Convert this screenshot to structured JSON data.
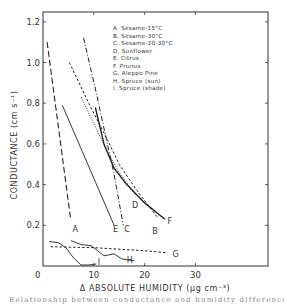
{
  "chart_data": {
    "type": "line",
    "title": "",
    "xlabel": "Δ ABSOLUTE HUMIDITY (μg cm⁻³)",
    "ylabel": "CONDUCTANCE (cm s⁻¹)",
    "xlim": [
      0,
      43
    ],
    "ylim": [
      0,
      1.25
    ],
    "x_ticks": [
      0,
      10,
      20,
      30
    ],
    "x_tick_labels": [
      "0",
      "10",
      "20",
      "30"
    ],
    "y_ticks": [
      0.2,
      0.4,
      0.6,
      0.8,
      1.0,
      1.2
    ],
    "y_tick_labels": [
      "0.2",
      "0.4",
      "0.6",
      "0.8",
      "1.0",
      "1.2"
    ],
    "origin_label": "0",
    "grid": false,
    "legend_position": "upper right (inside plot)",
    "legend": [
      "A. Sesame-15°C",
      "B. Sesame-30°C",
      "C. Sesame-20-30°C",
      "D. Sunflower",
      "E. Citrus",
      "F. Prunus",
      "G. Aleppo Pine",
      "H. Spruce (sun)",
      "I. Spruce (shade)"
    ],
    "series": [
      {
        "id": "A",
        "name": "Sesame-15°C",
        "style": "long-dash",
        "x": [
          0.8,
          5.4
        ],
        "y": [
          1.1,
          0.24
        ]
      },
      {
        "id": "B",
        "name": "Sesame-30°C",
        "style": "short-dash",
        "x": [
          5.2,
          9.0,
          12.5,
          15.0,
          18.5,
          22.5
        ],
        "y": [
          1.0,
          0.8,
          0.63,
          0.5,
          0.37,
          0.24
        ]
      },
      {
        "id": "C",
        "name": "Sesame-20-30°C",
        "style": "dash-dot",
        "x": [
          8.0,
          10.5,
          12.5,
          14.0,
          15.8
        ],
        "y": [
          1.12,
          0.85,
          0.62,
          0.45,
          0.2
        ]
      },
      {
        "id": "D",
        "name": "Sunflower",
        "style": "dotted",
        "x": [
          7.5,
          10.0,
          12.5,
          15.0,
          18.5
        ],
        "y": [
          0.83,
          0.7,
          0.57,
          0.46,
          0.34
        ]
      },
      {
        "id": "E",
        "name": "Citrus",
        "style": "solid",
        "x": [
          3.8,
          14.0
        ],
        "y": [
          0.79,
          0.2
        ]
      },
      {
        "id": "F",
        "name": "Prunus",
        "style": "solid-thick",
        "x": [
          10.3,
          12.0,
          14.0,
          16.5,
          20.0,
          24.0
        ],
        "y": [
          0.78,
          0.6,
          0.48,
          0.4,
          0.31,
          0.23
        ]
      },
      {
        "id": "G",
        "name": "Aleppo Pine",
        "style": "short-dash",
        "x": [
          1.5,
          10.0,
          20.0,
          24.5
        ],
        "y": [
          0.095,
          0.09,
          0.075,
          0.065
        ]
      },
      {
        "id": "H",
        "name": "Spruce (sun)",
        "style": "solid",
        "x": [
          5.5,
          7.5,
          9.5,
          12.0,
          14.0,
          15.5,
          18.0
        ],
        "y": [
          0.125,
          0.105,
          0.1,
          0.05,
          0.06,
          0.035,
          0.025
        ]
      },
      {
        "id": "I",
        "name": "Spruce (shade)",
        "style": "solid",
        "x": [
          1.2,
          3.0,
          4.5,
          6.0,
          7.5,
          9.0,
          10.5
        ],
        "y": [
          0.12,
          0.115,
          0.09,
          0.04,
          0.005,
          0.005,
          0.01
        ]
      }
    ],
    "curve_end_labels": {
      "A": {
        "x": 5.8,
        "y": 0.18
      },
      "E": {
        "x": 13.8,
        "y": 0.18
      },
      "C": {
        "x": 16.0,
        "y": 0.18
      },
      "D": {
        "x": 17.5,
        "y": 0.3
      },
      "B": {
        "x": 21.5,
        "y": 0.17
      },
      "F": {
        "x": 24.5,
        "y": 0.22
      },
      "G": {
        "x": 25.5,
        "y": 0.06
      },
      "H": {
        "x": 16.5,
        "y": 0.03
      },
      "I": {
        "x": 10.8,
        "y": 0.02
      }
    }
  },
  "caption": "Relationship between conductance and humidity difference"
}
